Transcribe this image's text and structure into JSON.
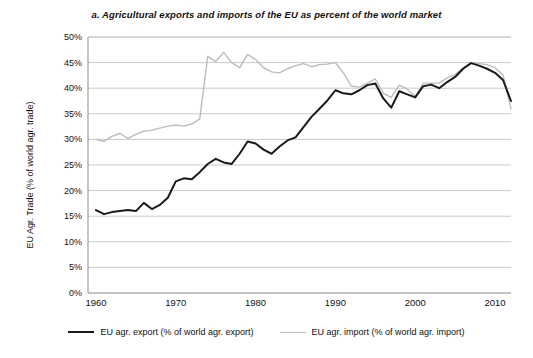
{
  "chart_data": {
    "type": "line",
    "title": "a. Agricultural exports and imports of the EU as percent of the world market",
    "xlabel": "",
    "ylabel": "EU Agr. Trade (% of world agr. trade)",
    "xlim": [
      1959,
      2012
    ],
    "ylim": [
      0,
      50
    ],
    "grid": true,
    "grid_axis": "y",
    "legend_position": "bottom",
    "ytick_labels": [
      "0%",
      "5%",
      "10%",
      "15%",
      "20%",
      "25%",
      "30%",
      "35%",
      "40%",
      "45%",
      "50%"
    ],
    "ytick_values": [
      0,
      5,
      10,
      15,
      20,
      25,
      30,
      35,
      40,
      45,
      50
    ],
    "xtick_labels": [
      "1960",
      "1970",
      "1980",
      "1990",
      "2000",
      "2010"
    ],
    "xtick_values": [
      1960,
      1970,
      1980,
      1990,
      2000,
      2010
    ],
    "x": [
      1960,
      1961,
      1962,
      1963,
      1964,
      1965,
      1966,
      1967,
      1968,
      1969,
      1970,
      1971,
      1972,
      1973,
      1974,
      1975,
      1976,
      1977,
      1978,
      1979,
      1980,
      1981,
      1982,
      1983,
      1984,
      1985,
      1986,
      1987,
      1988,
      1989,
      1990,
      1991,
      1992,
      1993,
      1994,
      1995,
      1996,
      1997,
      1998,
      1999,
      2000,
      2001,
      2002,
      2003,
      2004,
      2005,
      2006,
      2007,
      2008,
      2009,
      2010,
      2011
    ],
    "series": [
      {
        "name": "EU agr. export (% of world agr. export)",
        "color": "#1a1a1a",
        "width": 2,
        "values": [
          16.2,
          15.4,
          15.8,
          16.0,
          16.2,
          16.0,
          17.6,
          16.4,
          17.2,
          18.6,
          21.8,
          22.4,
          22.2,
          23.6,
          25.2,
          26.2,
          25.5,
          25.2,
          27.2,
          29.6,
          29.2,
          28.0,
          27.2,
          28.6,
          29.8,
          30.4,
          32.4,
          34.4,
          36.0,
          37.6,
          39.6,
          39.0,
          38.8,
          39.6,
          40.6,
          40.9,
          38.0,
          36.2,
          39.4,
          38.8,
          38.2,
          40.4,
          40.7,
          40.0,
          41.2,
          42.2,
          43.8,
          44.9,
          44.4,
          43.8,
          43.0,
          41.6
        ]
      },
      {
        "name": "EU agr. import (% of world agr. import)",
        "color": "#bcbcbc",
        "width": 1.4,
        "values": [
          30.0,
          29.6,
          30.6,
          31.2,
          30.2,
          31.0,
          31.6,
          31.8,
          32.2,
          32.6,
          32.8,
          32.6,
          33.0,
          34.0,
          46.2,
          45.2,
          47.0,
          45.0,
          44.0,
          46.6,
          45.6,
          44.0,
          43.2,
          43.0,
          43.8,
          44.4,
          44.8,
          44.2,
          44.6,
          44.7,
          45.0,
          43.0,
          40.4,
          40.2,
          41.0,
          41.8,
          39.0,
          38.2,
          40.6,
          39.8,
          38.4,
          41.0,
          41.0,
          41.0,
          42.0,
          42.7,
          44.0,
          45.0,
          44.8,
          44.6,
          44.0,
          42.6
        ]
      }
    ],
    "series_tail": {
      "note": "both series decline to 2011",
      "export_end": 37.5,
      "import_end": 36.0
    }
  },
  "legend": {
    "items": [
      {
        "label": "EU agr. export (% of world agr. export)",
        "key": "export"
      },
      {
        "label": "EU agr. import (% of world agr. import)",
        "key": "import"
      }
    ]
  }
}
